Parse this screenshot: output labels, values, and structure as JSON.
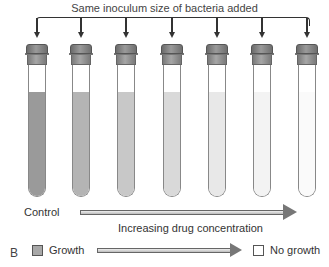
{
  "diagram": {
    "title": "Same inoculum size of bacteria added",
    "tubes": [
      {
        "name": "control",
        "x": 26,
        "fill_color": "#9a9a9a"
      },
      {
        "name": "tube-2",
        "x": 70,
        "fill_color": "#b4b4b4"
      },
      {
        "name": "tube-3",
        "x": 115,
        "fill_color": "#c8c8c8"
      },
      {
        "name": "tube-4",
        "x": 161,
        "fill_color": "#d9d9d9"
      },
      {
        "name": "tube-5",
        "x": 206,
        "fill_color": "#e8e8e8"
      },
      {
        "name": "tube-6",
        "x": 251,
        "fill_color": "#f3f3f3"
      },
      {
        "name": "tube-7",
        "x": 296,
        "fill_color": "#fafafa"
      }
    ],
    "control_label": "Control",
    "axis_label": "Increasing drug concentration",
    "panel_label": "B",
    "legend": {
      "growth_label": "Growth",
      "no_growth_label": "No growth",
      "growth_color": "#a8a8a8",
      "no_growth_color": "#ffffff"
    }
  }
}
